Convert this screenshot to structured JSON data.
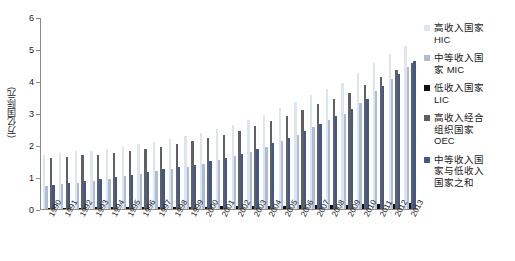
{
  "chart_data": {
    "type": "bar",
    "title": "",
    "xlabel": "",
    "ylabel": "(万亿国际元)",
    "ylim": [
      0,
      6
    ],
    "ytick_labels": [
      "0",
      "1",
      "2",
      "3",
      "4",
      "5",
      "6"
    ],
    "grid": false,
    "legend_position": "right",
    "categories": [
      "1990",
      "1991",
      "1992",
      "1993",
      "1994",
      "1995",
      "1996",
      "1997",
      "1998",
      "1999",
      "2000",
      "2001",
      "2002",
      "2003",
      "2004",
      "2005",
      "2006",
      "2007",
      "2008",
      "2009",
      "2010",
      "2011",
      "2012",
      "2013"
    ],
    "series": [
      {
        "name": "高收入国家 HIC",
        "short": "HIC",
        "color": "#dde5f0",
        "values": [
          1.7,
          1.75,
          1.8,
          1.82,
          1.88,
          1.95,
          2.02,
          2.1,
          2.18,
          2.28,
          2.38,
          2.5,
          2.62,
          2.78,
          2.95,
          3.15,
          3.35,
          3.55,
          3.75,
          3.95,
          4.25,
          4.55,
          4.85,
          5.1
        ]
      },
      {
        "name": "中等收入国家 MIC",
        "short": "MIC",
        "color": "#aebdd6",
        "values": [
          0.72,
          0.78,
          0.82,
          0.88,
          0.95,
          1.02,
          1.1,
          1.18,
          1.25,
          1.32,
          1.42,
          1.52,
          1.65,
          1.78,
          1.95,
          2.12,
          2.32,
          2.55,
          2.78,
          2.98,
          3.3,
          3.68,
          4.05,
          4.45
        ]
      },
      {
        "name": "低收入国家 LIC",
        "short": "LIC",
        "color": "#111111",
        "values": [
          0.04,
          0.04,
          0.04,
          0.05,
          0.05,
          0.05,
          0.06,
          0.06,
          0.06,
          0.07,
          0.07,
          0.08,
          0.08,
          0.09,
          0.1,
          0.1,
          0.11,
          0.12,
          0.13,
          0.14,
          0.15,
          0.16,
          0.17,
          0.18
        ]
      },
      {
        "name": "高收入经合组织国家 OEC",
        "short": "OEC",
        "color": "#5f6063",
        "values": [
          1.6,
          1.64,
          1.68,
          1.7,
          1.75,
          1.82,
          1.88,
          1.95,
          2.02,
          2.12,
          2.22,
          2.32,
          2.45,
          2.58,
          2.75,
          2.92,
          3.1,
          3.28,
          3.45,
          3.62,
          3.88,
          4.12,
          4.35,
          4.55
        ]
      },
      {
        "name": "中等收入国家与低收入国家之和",
        "short": "MIC+LIC",
        "color": "#41598a",
        "values": [
          0.76,
          0.82,
          0.86,
          0.93,
          1.0,
          1.07,
          1.16,
          1.24,
          1.31,
          1.39,
          1.49,
          1.6,
          1.73,
          1.87,
          2.05,
          2.22,
          2.43,
          2.67,
          2.91,
          3.12,
          3.45,
          3.84,
          4.22,
          4.63
        ]
      }
    ]
  },
  "legend": {
    "items": [
      {
        "label": "高收入国家\nHIC",
        "swatch_class": "sw-hic",
        "name": "legend-item-hic"
      },
      {
        "label": "中等收入国\n家 MIC",
        "swatch_class": "sw-mic",
        "name": "legend-item-mic"
      },
      {
        "label": "低收入国家\nLIC",
        "swatch_class": "sw-lic",
        "name": "legend-item-lic"
      },
      {
        "label": "高收入经合\n组织国家\nOEC",
        "swatch_class": "sw-oec",
        "name": "legend-item-oec"
      },
      {
        "label": "中等收入国\n家与低收入\n国家之和",
        "swatch_class": "sw-sum",
        "name": "legend-item-sum"
      }
    ]
  }
}
